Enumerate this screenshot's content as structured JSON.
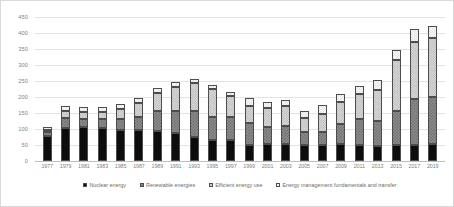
{
  "chart_data": {
    "type": "bar",
    "subtype": "stacked-column",
    "title": "",
    "xlabel": "",
    "ylabel": "",
    "ylim": [
      0,
      450
    ],
    "ytick_step": 50,
    "yticks": [
      0,
      50,
      100,
      150,
      200,
      250,
      300,
      350,
      400,
      450
    ],
    "grid": true,
    "legend_position": "bottom",
    "categories": [
      "1977",
      "1979",
      "1981",
      "1983",
      "1985",
      "1987",
      "1989",
      "1991",
      "1993",
      "1995",
      "1997",
      "1999",
      "2001",
      "2003",
      "2005",
      "2007",
      "2009",
      "2011",
      "2013",
      "2015",
      "2017",
      "2019"
    ],
    "series": [
      {
        "name": "Nuclear energy",
        "pattern": "solid-black",
        "values": [
          78,
          103,
          105,
          103,
          97,
          96,
          93,
          86,
          76,
          66,
          66,
          50,
          52,
          54,
          49,
          51,
          52,
          49,
          47,
          50,
          51,
          52
        ]
      },
      {
        "name": "Renewable energies",
        "pattern": "grey-checker",
        "values": [
          12,
          33,
          27,
          28,
          35,
          40,
          62,
          71,
          79,
          73,
          72,
          70,
          54,
          56,
          42,
          41,
          65,
          81,
          77,
          107,
          142,
          147
        ]
      },
      {
        "name": "Efficient energy use",
        "pattern": "light-dots",
        "values": [
          8,
          19,
          22,
          23,
          30,
          46,
          58,
          75,
          88,
          85,
          65,
          53,
          61,
          62,
          45,
          54,
          66,
          78,
          97,
          159,
          180,
          186
        ]
      },
      {
        "name": "Energy management fundamentals and transfer",
        "pattern": "white-dots",
        "values": [
          8,
          16,
          14,
          14,
          15,
          14,
          15,
          15,
          13,
          15,
          13,
          25,
          16,
          20,
          20,
          29,
          28,
          27,
          31,
          30,
          39,
          38
        ]
      }
    ],
    "totals": [
      106,
      171,
      168,
      168,
      177,
      196,
      228,
      247,
      256,
      239,
      216,
      198,
      183,
      192,
      156,
      175,
      211,
      235,
      252,
      346,
      412,
      423
    ]
  },
  "legend": {
    "items": [
      {
        "label": "Nuclear energy"
      },
      {
        "label": "Renewable energies"
      },
      {
        "label": "Efficient energy use"
      },
      {
        "label": "Energy management fundamentals and transfer"
      }
    ]
  }
}
